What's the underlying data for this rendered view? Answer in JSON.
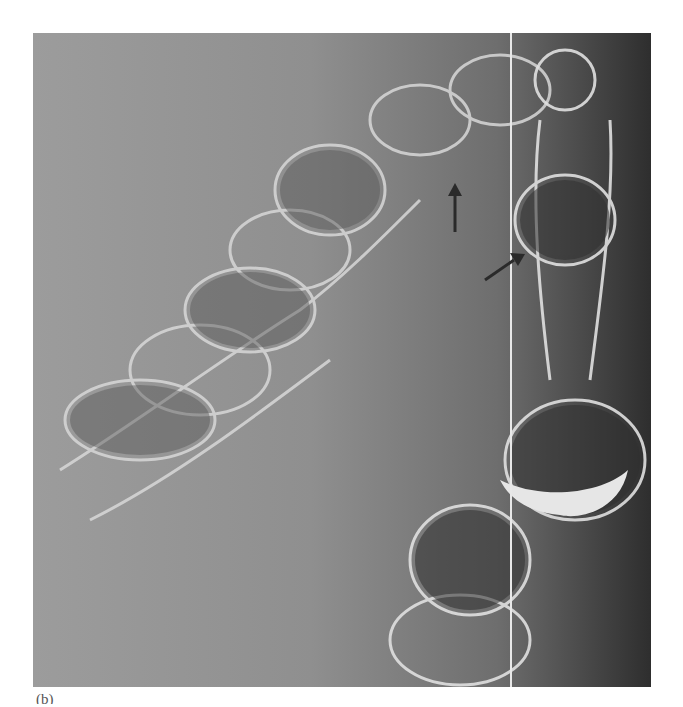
{
  "figure": {
    "panel_label": "(b)",
    "annotations": [
      {
        "type": "arrow",
        "direction": "up",
        "from": [
          455,
          232
        ],
        "to": [
          455,
          183
        ],
        "color": "#2a2a2a"
      },
      {
        "type": "arrow",
        "direction": "up-right",
        "from": [
          485,
          280
        ],
        "to": [
          524,
          254
        ],
        "color": "#2a2a2a"
      }
    ],
    "overlay_line": {
      "x": 511,
      "color": "#e8e8e8"
    }
  }
}
